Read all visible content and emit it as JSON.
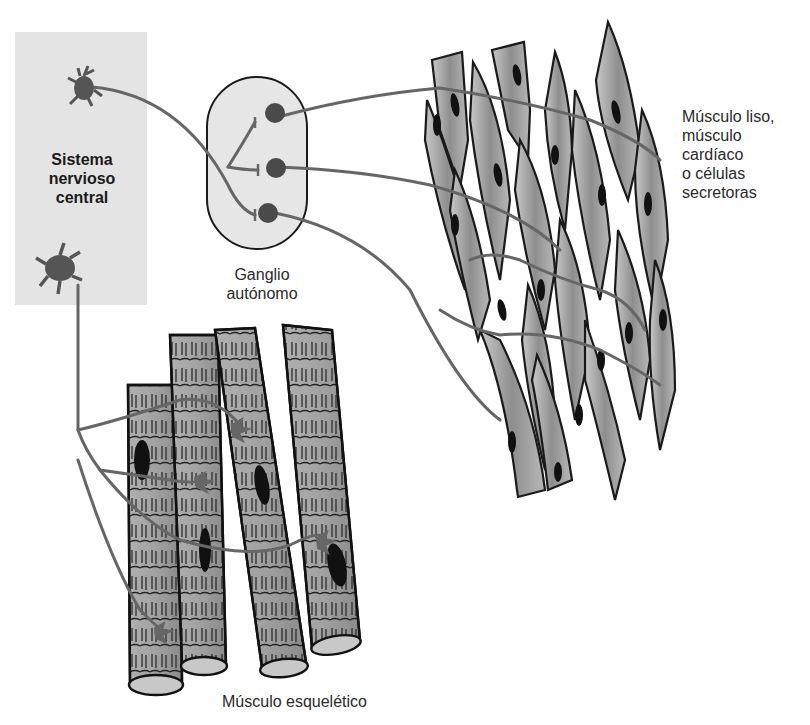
{
  "figure": {
    "type": "anatomical-diagram"
  },
  "labels": {
    "cns": [
      "Sistema",
      "nervioso",
      "central"
    ],
    "ganglion": [
      "Ganglio",
      "autónomo"
    ],
    "smooth_muscle": [
      "Músculo liso,",
      "músculo",
      "cardíaco",
      "o células",
      "secretoras"
    ],
    "skeletal_muscle": "Músculo esquelético"
  },
  "colors": {
    "cns_panel": "#e4e4e4",
    "ganglion_fill": "#e6e6e6",
    "neuron_body": "#555555",
    "nerve_fiber": "#666666",
    "muscle_fill": "#9a9a9a",
    "outline": "#1a1a1a"
  },
  "elements": {
    "cns_neurons": [
      "autonomic-preganglionic-neuron",
      "somatic-motor-neuron"
    ],
    "ganglion_neurons": 3,
    "smooth_muscle_cells": 17,
    "skeletal_fibers": 5
  }
}
